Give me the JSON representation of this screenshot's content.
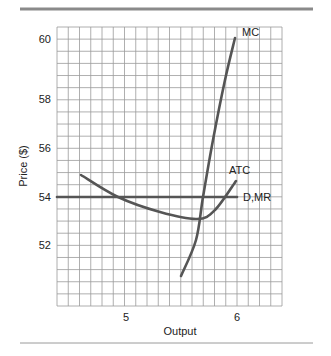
{
  "colors": {
    "rule": "#8a8a8a",
    "grid": "#9a9a9a",
    "curve": "#555555",
    "text": "#222222"
  },
  "chart_data": {
    "type": "line",
    "title": "",
    "xlabel": "Output",
    "ylabel": "Price ($)",
    "x_ticks": [
      {
        "label": "5",
        "value": 5,
        "px": 126
      },
      {
        "label": "6",
        "value": 6,
        "px": 237
      }
    ],
    "y_ticks": [
      {
        "label": "60",
        "value": 60,
        "py": 39
      },
      {
        "label": "58",
        "value": 58,
        "py": 99
      },
      {
        "label": "56",
        "value": 56,
        "py": 148
      },
      {
        "label": "54",
        "value": 54,
        "py": 197
      },
      {
        "label": "52",
        "value": 52,
        "py": 245
      }
    ],
    "grid": true,
    "plot_area": {
      "left": 57,
      "top": 27,
      "right": 282,
      "bottom": 306,
      "cols": 20,
      "rows": 23
    },
    "series": [
      {
        "name": "MC",
        "label": "MC",
        "points": [
          [
            5.5,
            50.8
          ],
          [
            5.63,
            52.2
          ],
          [
            5.69,
            54.0
          ],
          [
            5.78,
            56.3
          ],
          [
            5.89,
            58.8
          ],
          [
            5.98,
            60.0
          ]
        ],
        "px": [
          [
            181,
            276
          ],
          [
            196,
            240
          ],
          [
            203,
            197
          ],
          [
            213,
            140
          ],
          [
            225,
            80
          ],
          [
            235,
            38
          ]
        ],
        "label_pos": [
          242,
          36
        ]
      },
      {
        "name": "ATC",
        "label": "ATC",
        "points": [
          [
            4.59,
            54.9
          ],
          [
            4.93,
            54.0
          ],
          [
            5.31,
            53.4
          ],
          [
            5.64,
            53.1
          ],
          [
            5.8,
            53.5
          ],
          [
            5.99,
            54.7
          ]
        ],
        "px": [
          [
            81,
            175
          ],
          [
            118,
            197
          ],
          [
            160,
            212
          ],
          [
            197,
            219
          ],
          [
            215,
            210
          ],
          [
            236,
            181
          ]
        ],
        "label_pos": [
          229,
          174
        ]
      },
      {
        "name": "D,MR",
        "label": "D,MR",
        "points": [
          [
            4.38,
            54.0
          ],
          [
            6.0,
            54.0
          ]
        ],
        "px": [
          [
            57,
            197
          ],
          [
            237,
            197
          ]
        ],
        "label_pos": [
          243,
          201
        ]
      }
    ]
  }
}
